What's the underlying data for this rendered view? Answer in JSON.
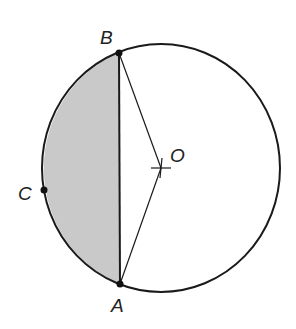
{
  "diagram": {
    "colors": {
      "stroke": "#1a1a1a",
      "shade": "#c9c9c9",
      "background": "#ffffff"
    },
    "points": {
      "A": {
        "label": "A",
        "role": "point on circle, lower end of chord"
      },
      "B": {
        "label": "B",
        "role": "point on circle, upper end of chord"
      },
      "C": {
        "label": "C",
        "role": "point on minor arc AB"
      },
      "O": {
        "label": "O",
        "role": "centre of circle"
      }
    },
    "segments": [
      "OB",
      "OA",
      "AB"
    ],
    "shaded_region": "minor segment bounded by chord AB and arc ACB"
  }
}
